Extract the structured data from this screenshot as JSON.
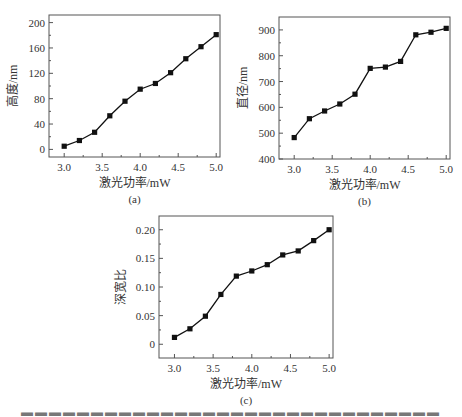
{
  "chart_data": [
    {
      "id": "a",
      "type": "line",
      "panel_label": "(a)",
      "title": "",
      "xlabel": "激光功率/mW",
      "ylabel": "高度/nm",
      "x": [
        3.0,
        3.2,
        3.4,
        3.6,
        3.8,
        4.0,
        4.2,
        4.4,
        4.6,
        4.8,
        5.0
      ],
      "series": [
        {
          "name": "高度",
          "values": [
            5,
            14,
            27,
            53,
            76,
            95,
            104,
            121,
            143,
            162,
            181
          ],
          "marker": "square",
          "color": "#111111"
        }
      ],
      "xlim": [
        2.8,
        5.05
      ],
      "ylim": [
        -12,
        212
      ],
      "xticks": [
        3.0,
        3.5,
        4.0,
        4.5,
        5.0
      ],
      "xtick_labels": [
        "3.0",
        "3.5",
        "4.0",
        "4.5",
        "5.0"
      ],
      "yticks": [
        0,
        40,
        80,
        120,
        160,
        200
      ],
      "ytick_labels": [
        "0",
        "40",
        "80",
        "120",
        "160",
        "200"
      ],
      "grid": false,
      "legend": "none"
    },
    {
      "id": "b",
      "type": "line",
      "panel_label": "(b)",
      "title": "",
      "xlabel": "激光功率/mW",
      "ylabel": "直径/nm",
      "x": [
        3.0,
        3.2,
        3.4,
        3.6,
        3.8,
        4.0,
        4.2,
        4.4,
        4.6,
        4.8,
        5.0
      ],
      "series": [
        {
          "name": "直径",
          "values": [
            483,
            556,
            586,
            613,
            651,
            751,
            756,
            778,
            881,
            891,
            906
          ],
          "marker": "square",
          "color": "#111111"
        }
      ],
      "xlim": [
        2.8,
        5.05
      ],
      "ylim": [
        400,
        950
      ],
      "xticks": [
        3.0,
        3.5,
        4.0,
        4.5,
        5.0
      ],
      "xtick_labels": [
        "3.0",
        "3.5",
        "4.0",
        "4.5",
        "5.0"
      ],
      "yticks": [
        400,
        500,
        600,
        700,
        800,
        900
      ],
      "ytick_labels": [
        "400",
        "500",
        "600",
        "700",
        "800",
        "900"
      ],
      "grid": false,
      "legend": "none"
    },
    {
      "id": "c",
      "type": "line",
      "panel_label": "(c)",
      "title": "",
      "xlabel": "激光功率/mW",
      "ylabel": "深宽比",
      "x": [
        3.0,
        3.2,
        3.4,
        3.6,
        3.8,
        4.0,
        4.2,
        4.4,
        4.6,
        4.8,
        5.0
      ],
      "series": [
        {
          "name": "深宽比",
          "values": [
            0.012,
            0.027,
            0.049,
            0.087,
            0.119,
            0.128,
            0.139,
            0.156,
            0.163,
            0.181,
            0.2
          ],
          "marker": "square",
          "color": "#111111"
        }
      ],
      "xlim": [
        2.8,
        5.05
      ],
      "ylim": [
        -0.024,
        0.224
      ],
      "xticks": [
        3.0,
        3.5,
        4.0,
        4.5,
        5.0
      ],
      "xtick_labels": [
        "3.0",
        "3.5",
        "4.0",
        "4.5",
        "5.0"
      ],
      "yticks": [
        0,
        0.05,
        0.1,
        0.15,
        0.2
      ],
      "ytick_labels": [
        "0",
        "0.05",
        "0.10",
        "0.15",
        "0.20"
      ],
      "grid": false,
      "legend": "none"
    }
  ],
  "layout": {
    "panels": [
      {
        "id": "a",
        "box": [
          49,
          15,
          171,
          142
        ]
      },
      {
        "id": "b",
        "box": [
          279,
          17,
          171,
          142
        ]
      },
      {
        "id": "c",
        "box": [
          159,
          216,
          174,
          142
        ]
      }
    ]
  }
}
